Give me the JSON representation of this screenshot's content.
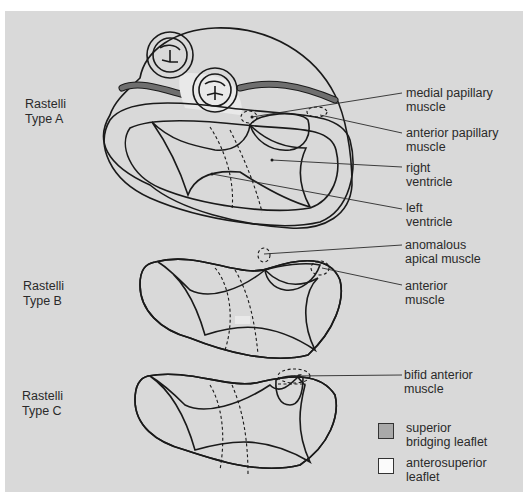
{
  "figure": {
    "background_color": "#d9d9d9",
    "colors": {
      "superior_bridging_leaflet": "#a9a9a9",
      "anterosuperior_leaflet": "#fbfbfb",
      "other_leaflet": "#e9e9e9",
      "heart_wall": "#b0b0b0",
      "band": "#6f6f6f",
      "outline": "#1a1a1a"
    }
  },
  "types": [
    {
      "id": "A",
      "label": "Rastelli\nType A"
    },
    {
      "id": "B",
      "label": "Rastelli\nType B"
    },
    {
      "id": "C",
      "label": "Rastelli\nType C"
    }
  ],
  "annotations": [
    {
      "id": "medial-papillary-muscle",
      "label": "medial papillary\nmuscle"
    },
    {
      "id": "anterior-papillary-muscle",
      "label": "anterior papillary\nmuscle"
    },
    {
      "id": "right-ventricle",
      "label": "right\nventricle"
    },
    {
      "id": "left-ventricle",
      "label": "left\nventricle"
    },
    {
      "id": "anomalous-apical-muscle",
      "label": "anomalous\napical muscle"
    },
    {
      "id": "anterior-muscle",
      "label": "anterior\nmuscle"
    },
    {
      "id": "bifid-anterior-muscle",
      "label": "bifid anterior\nmuscle"
    }
  ],
  "legend": [
    {
      "label": "superior\nbridging leaflet",
      "color": "#a9a9a9"
    },
    {
      "label": "anterosuperior\nleaflet",
      "color": "#fbfbfb"
    }
  ]
}
